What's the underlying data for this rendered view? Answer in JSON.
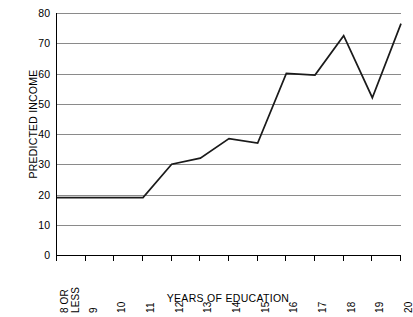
{
  "chart_data": {
    "type": "line",
    "title": "",
    "xlabel": "YEARS OF EDUCATION",
    "ylabel": "PREDICTED INCOME",
    "categories": [
      "8 OR\nLESS",
      "9",
      "10",
      "11",
      "12",
      "13",
      "14",
      "15",
      "16",
      "17",
      "18",
      "19",
      "20"
    ],
    "values": [
      19,
      19,
      19,
      19,
      30,
      32,
      38.5,
      37,
      60,
      59.5,
      72.5,
      52,
      76.5
    ],
    "ylim": [
      0,
      80
    ],
    "yticks": [
      0,
      10,
      20,
      30,
      40,
      50,
      60,
      70,
      80
    ],
    "ytick_labels": [
      "0",
      "10",
      "20",
      "30",
      "40",
      "50",
      "60",
      "70",
      "80"
    ],
    "grid": true,
    "legend": false,
    "series_color": "#1a1a1a",
    "grid_color": "#8a8a8a",
    "axis_color": "#000000",
    "background": "#ffffff"
  }
}
